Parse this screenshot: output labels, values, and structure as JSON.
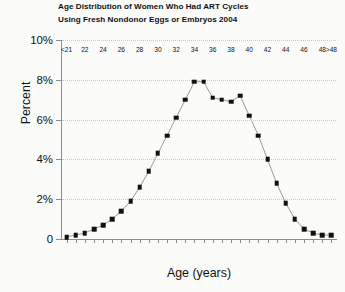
{
  "chart_data": {
    "type": "line",
    "title": "Age Distribution of Women Who Had ART Cycles Using Fresh Nondonor Eggs or Embryos 2004",
    "title_line1": "Age Distribution of Women Who Had ART Cycles",
    "title_line2": "Using Fresh Nondonor Eggs or Embryos 2004",
    "xlabel": "Age (years)",
    "ylabel": "Percent",
    "ylim": [
      0,
      10
    ],
    "yticks": [
      0,
      2,
      4,
      6,
      8,
      10
    ],
    "ytick_labels": [
      "0",
      "2%",
      "4%",
      "6%",
      "8%",
      "10%"
    ],
    "grid": true,
    "grid_axis": "y",
    "legend": "none",
    "marker": "square",
    "marker_color": "#111111",
    "line_color": "#9a9a9a",
    "categories": [
      "<21",
      "21",
      "22",
      "23",
      "24",
      "25",
      "26",
      "27",
      "28",
      "29",
      "30",
      "31",
      "32",
      "33",
      "34",
      "35",
      "36",
      "37",
      "38",
      "39",
      "40",
      "41",
      "42",
      "43",
      "44",
      "45",
      "46",
      "47",
      "48",
      ">48"
    ],
    "xtick_labels": [
      "<21",
      "22",
      "24",
      "26",
      "28",
      "30",
      "32",
      "34",
      "36",
      "38",
      "40",
      "42",
      "44",
      "46",
      "48",
      ">48"
    ],
    "values": [
      0.1,
      0.2,
      0.3,
      0.5,
      0.7,
      1.0,
      1.4,
      1.9,
      2.6,
      3.4,
      4.3,
      5.2,
      6.1,
      7.0,
      7.9,
      7.9,
      7.1,
      7.0,
      6.9,
      7.2,
      6.2,
      5.2,
      4.0,
      2.8,
      1.8,
      1.0,
      0.5,
      0.3,
      0.2,
      0.2
    ]
  }
}
